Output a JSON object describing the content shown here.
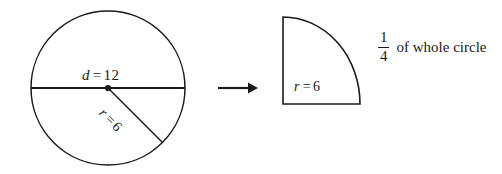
{
  "figure": {
    "type": "geometry-diagram",
    "background_color": "#ffffff",
    "stroke_color": "#1a1a1a",
    "whole_circle": {
      "center": {
        "x": 108,
        "y": 88
      },
      "radius_px": 77,
      "diameter_label": {
        "variable": "d",
        "equals": "=",
        "value": "12"
      },
      "radius_label": {
        "variable": "r",
        "equals": "=",
        "value": "6"
      },
      "center_dot": true,
      "diameter_chord": true,
      "radius_segment_angle_deg": 45
    },
    "arrow": {
      "name": "right-arrow",
      "glyph": "→",
      "x_start": 218,
      "x_end": 256,
      "y": 88
    },
    "quarter_circle": {
      "corner": {
        "x": 283,
        "y": 17
      },
      "width_px": 77,
      "height_px": 87,
      "radius_label": {
        "variable": "r",
        "equals": "=",
        "value": "6"
      }
    },
    "fraction": {
      "numerator": "1",
      "denominator": "4"
    },
    "caption": "of whole circle"
  }
}
